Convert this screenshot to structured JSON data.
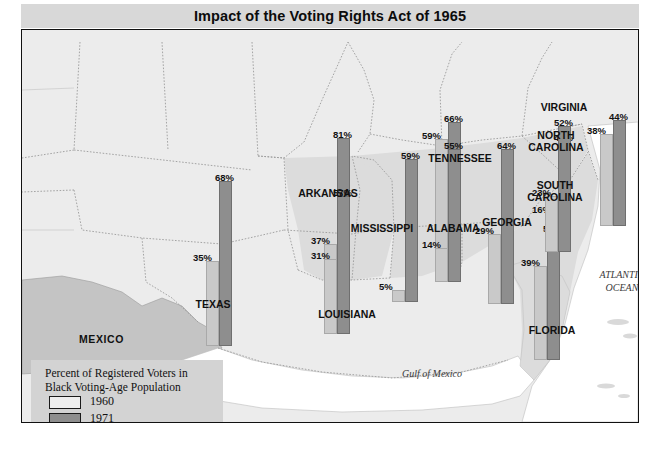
{
  "title": "Impact of the Voting Rights Act of 1965",
  "legend": {
    "title_line1": "Percent of Registered Voters in",
    "title_line2": "Black Voting-Age Population",
    "year_1960": "1960",
    "year_1971": "1971",
    "color_1960": "#eeeeee",
    "color_1971": "#8e8e8e"
  },
  "water_labels": [
    {
      "name": "gulf-of-mexico",
      "text": "Gulf of Mexico",
      "x": 355,
      "y": 337,
      "w": 110
    },
    {
      "name": "atlantic-ocean",
      "text": "ATLANTIC\nOCEAN",
      "x": 560,
      "y": 238,
      "w": 80
    }
  ],
  "country_labels": [
    {
      "name": "mexico",
      "text": "MEXICO",
      "x": 57,
      "y": 303
    }
  ],
  "state_labels": [
    {
      "name": "texas",
      "text": "TEXAS",
      "x": 161,
      "y": 268,
      "w": 60
    },
    {
      "name": "arkansas",
      "text": "ARKANSAS",
      "x": 268,
      "y": 157,
      "w": 76
    },
    {
      "name": "louisiana",
      "text": "LOUISIANA",
      "x": 287,
      "y": 278,
      "w": 76
    },
    {
      "name": "mississippi",
      "text": "MISSISSIPPI",
      "x": 320,
      "y": 192,
      "w": 80
    },
    {
      "name": "tennessee",
      "text": "TENNESSEE",
      "x": 395,
      "y": 122,
      "w": 86
    },
    {
      "name": "alabama",
      "text": "ALABAMA",
      "x": 394,
      "y": 192,
      "w": 74
    },
    {
      "name": "georgia",
      "text": "GEORGIA",
      "x": 451,
      "y": 186,
      "w": 68
    },
    {
      "name": "florida",
      "text": "FLORIDA",
      "x": 497,
      "y": 294,
      "w": 66
    },
    {
      "name": "virginia",
      "text": "VIRGINIA",
      "x": 508,
      "y": 71,
      "w": 68
    },
    {
      "name": "north-carolina",
      "text": "NORTH\nCAROLINA",
      "x": 495,
      "y": 99,
      "w": 78
    },
    {
      "name": "south-carolina",
      "text": "SOUTH\nCAROLINA",
      "x": 494,
      "y": 149,
      "w": 78
    }
  ],
  "chart_data": {
    "type": "bar",
    "title": "Impact of the Voting Rights Act of 1965",
    "ylabel": "Percent of Registered Voters in Black Voting-Age Population",
    "unit": "%",
    "ylim": [
      0,
      100
    ],
    "categories": [
      "Texas",
      "Arkansas",
      "Louisiana",
      "Mississippi",
      "Tennessee",
      "Alabama",
      "Georgia",
      "Florida",
      "South Carolina",
      "North Carolina",
      "Virginia"
    ],
    "series": [
      {
        "name": "1960",
        "color": "#c9c9c9",
        "values": [
          35,
          37,
          31,
          5,
          59,
          14,
          29,
          39,
          16,
          38,
          23
        ]
      },
      {
        "name": "1971",
        "color": "#8e8e8e",
        "values": [
          68,
          81,
          57,
          59,
          66,
          55,
          64,
          53,
          46,
          44,
          52
        ]
      }
    ],
    "legend_position": "bottom-left"
  },
  "bars": [
    {
      "name": "texas",
      "x": 184,
      "base": 316,
      "v60": 35,
      "v71": 68,
      "t60": "35%",
      "t71": "68%",
      "lab60_dy": 2,
      "lab71_dy": 2
    },
    {
      "name": "arkansas",
      "x": 302,
      "base": 304,
      "v60": 37,
      "v71": 81,
      "t60": "37%",
      "t71": "81%",
      "lab60_dy": 2,
      "lab71_dy": 2
    },
    {
      "name": "louisiana",
      "x": 302,
      "base": 304,
      "v60": 31,
      "v71": 57,
      "t60": "31%",
      "t71": "57%",
      "lab60_dy": 2,
      "lab71_dy": 2,
      "second": true
    },
    {
      "name": "mississippi",
      "x": 370,
      "base": 272,
      "v60": 5,
      "v71": 59,
      "t60": "5%",
      "t71": "59%",
      "lab60_dy": 2,
      "lab71_dy": 2
    },
    {
      "name": "tennessee",
      "x": 413,
      "base": 252,
      "v60": 59,
      "v71": 66,
      "t60": "59%",
      "t71": "66%",
      "lab60_dy": 2,
      "lab71_dy": 2
    },
    {
      "name": "alabama",
      "x": 413,
      "base": 252,
      "v60": 14,
      "v71": 55,
      "t60": "14%",
      "t71": "55%",
      "lab60_dy": 2,
      "lab71_dy": 2,
      "second": true
    },
    {
      "name": "georgia",
      "x": 466,
      "base": 274,
      "v60": 29,
      "v71": 64,
      "t60": "29%",
      "t71": "64%",
      "lab60_dy": 2,
      "lab71_dy": 2
    },
    {
      "name": "florida",
      "x": 512,
      "base": 330,
      "v60": 39,
      "v71": 53,
      "t60": "39%",
      "t71": "53%",
      "lab60_dy": 2,
      "lab71_dy": 2
    },
    {
      "name": "south-carolina",
      "x": 523,
      "base": 222,
      "v60": 16,
      "v71": 46,
      "t60": "16%",
      "t71": "46%",
      "lab60_dy": 2,
      "lab71_dy": 2
    },
    {
      "name": "virginia",
      "x": 523,
      "base": 222,
      "v60": 23,
      "v71": 52,
      "t60": "23%",
      "t71": "52%",
      "lab60_dy": 2,
      "lab71_dy": 2,
      "second": true
    },
    {
      "name": "north-carolina",
      "x": 578,
      "base": 196,
      "v60": 38,
      "v71": 44,
      "t60": "38%",
      "t71": "44%",
      "lab60_dy": 2,
      "lab71_dy": 2
    }
  ]
}
